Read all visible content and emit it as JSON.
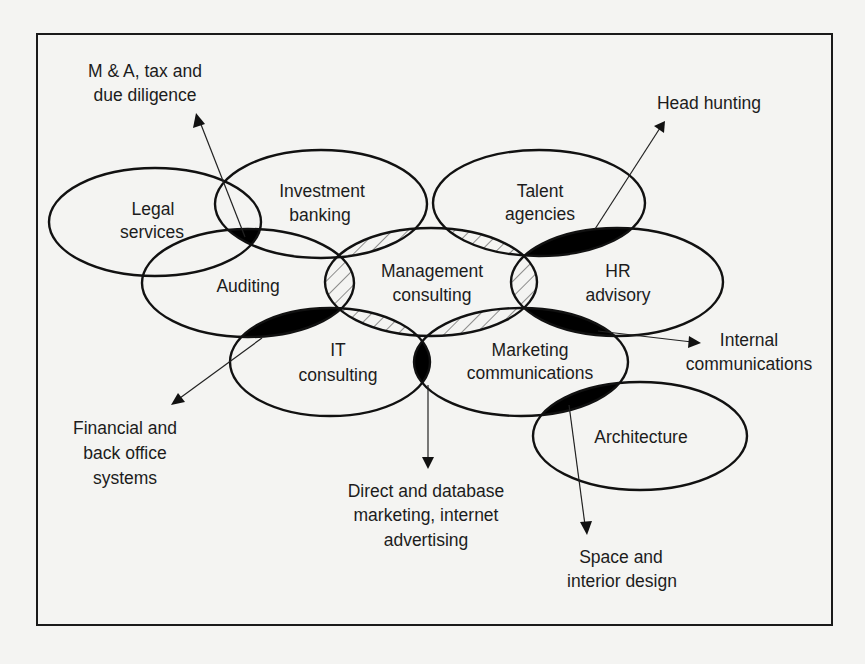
{
  "diagram": {
    "colors": {
      "background": "#f4f4f2",
      "stroke": "#111111",
      "overlap_fill": "#000000",
      "hatch": "#555555",
      "text": "#1c1c1c"
    },
    "ellipses": [
      {
        "id": "legal-services",
        "lines": [
          "Legal",
          "services"
        ],
        "cx": 155,
        "cy": 222,
        "rx": 106,
        "ry": 54
      },
      {
        "id": "investment-banking",
        "lines": [
          "Investment",
          "banking"
        ],
        "cx": 321,
        "cy": 204,
        "rx": 106,
        "ry": 54
      },
      {
        "id": "talent-agencies",
        "lines": [
          "Talent",
          "agencies"
        ],
        "cx": 539,
        "cy": 203,
        "rx": 106,
        "ry": 53
      },
      {
        "id": "auditing",
        "lines": [
          "Auditing"
        ],
        "cx": 248,
        "cy": 283,
        "rx": 106,
        "ry": 54
      },
      {
        "id": "management-consulting",
        "lines": [
          "Management",
          "consulting"
        ],
        "cx": 431,
        "cy": 282,
        "rx": 106,
        "ry": 54
      },
      {
        "id": "hr-advisory",
        "lines": [
          "HR",
          "advisory"
        ],
        "cx": 617,
        "cy": 282,
        "rx": 106,
        "ry": 54
      },
      {
        "id": "it-consulting",
        "lines": [
          "IT",
          "consulting"
        ],
        "cx": 330,
        "cy": 362,
        "rx": 100,
        "ry": 54
      },
      {
        "id": "marketing-communications",
        "lines": [
          "Marketing",
          "communications"
        ],
        "cx": 521,
        "cy": 362,
        "rx": 107,
        "ry": 54
      },
      {
        "id": "architecture",
        "lines": [
          "Architecture"
        ],
        "cx": 640,
        "cy": 436,
        "rx": 107,
        "ry": 54
      }
    ],
    "labels": {
      "legal_services": [
        "Legal",
        "services"
      ],
      "investment_banking": [
        "Investment",
        "banking"
      ],
      "talent_agencies": [
        "Talent",
        "agencies"
      ],
      "auditing": "Auditing",
      "management_consulting": [
        "Management",
        "consulting"
      ],
      "hr_advisory": [
        "HR",
        "advisory"
      ],
      "it_consulting": [
        "IT",
        "consulting"
      ],
      "marketing_communications": [
        "Marketing",
        "communications"
      ],
      "architecture": "Architecture"
    },
    "overlap_callouts": {
      "ma_tax": {
        "lines": [
          "M & A, tax and",
          "due diligence"
        ],
        "between": [
          "legal-services",
          "investment-banking",
          "auditing"
        ]
      },
      "head_hunting": {
        "lines": [
          "Head hunting"
        ],
        "between": [
          "talent-agencies",
          "hr-advisory"
        ]
      },
      "internal_communications": {
        "lines": [
          "Internal",
          "communications"
        ],
        "between": [
          "hr-advisory",
          "marketing-communications"
        ]
      },
      "financial_systems": {
        "lines": [
          "Financial and",
          "back office",
          "systems"
        ],
        "between": [
          "auditing",
          "it-consulting"
        ]
      },
      "direct_marketing": {
        "lines": [
          "Direct and database",
          "marketing, internet",
          "advertising"
        ],
        "between": [
          "it-consulting",
          "marketing-communications"
        ]
      },
      "space_design": {
        "lines": [
          "Space and",
          "interior design"
        ],
        "between": [
          "marketing-communications",
          "architecture"
        ]
      }
    },
    "hatched_overlaps": [
      [
        "management-consulting",
        "investment-banking"
      ],
      [
        "management-consulting",
        "talent-agencies"
      ],
      [
        "management-consulting",
        "auditing"
      ],
      [
        "management-consulting",
        "hr-advisory"
      ],
      [
        "management-consulting",
        "it-consulting"
      ],
      [
        "management-consulting",
        "marketing-communications"
      ]
    ]
  }
}
